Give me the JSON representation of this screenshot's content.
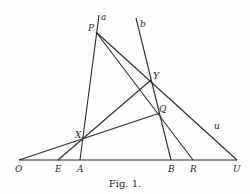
{
  "figure": {
    "caption": "Fig. 1.",
    "colors": {
      "ink": "#2b2b2b",
      "paper": "#fefefe"
    },
    "points": [
      {
        "id": "P",
        "x": 96,
        "y": 32,
        "lx": 88,
        "ly": 31
      },
      {
        "id": "Y",
        "x": 151,
        "y": 80,
        "lx": 153,
        "ly": 79
      },
      {
        "id": "Q",
        "x": 160,
        "y": 113,
        "lx": 159,
        "ly": 112
      },
      {
        "id": "X",
        "x": 82,
        "y": 138,
        "lx": 75,
        "ly": 138
      },
      {
        "id": "O",
        "x": 19,
        "y": 160,
        "lx": 15,
        "ly": 172
      },
      {
        "id": "E",
        "x": 58,
        "y": 160,
        "lx": 55,
        "ly": 172
      },
      {
        "id": "A",
        "x": 80,
        "y": 160,
        "lx": 77,
        "ly": 172
      },
      {
        "id": "B",
        "x": 171,
        "y": 160,
        "lx": 168,
        "ly": 172
      },
      {
        "id": "R",
        "x": 193,
        "y": 160,
        "lx": 190,
        "ly": 172
      },
      {
        "id": "U",
        "x": 237,
        "y": 160,
        "lx": 233,
        "ly": 172
      }
    ],
    "line_labels": [
      {
        "id": "a",
        "x": 101,
        "y": 20
      },
      {
        "id": "b",
        "x": 140,
        "y": 27
      },
      {
        "id": "u",
        "x": 214,
        "y": 129
      }
    ],
    "lines": [
      {
        "name": "line-a",
        "x1": 99,
        "y1": 15,
        "x2": 80,
        "y2": 160
      },
      {
        "name": "line-b",
        "x1": 136,
        "y1": 18,
        "x2": 171,
        "y2": 160
      },
      {
        "name": "line-PU",
        "x1": 96,
        "y1": 32,
        "x2": 237,
        "y2": 160
      },
      {
        "name": "line-PR",
        "x1": 96,
        "y1": 32,
        "x2": 193,
        "y2": 160
      },
      {
        "name": "line-OQ",
        "x1": 19,
        "y1": 160,
        "x2": 160,
        "y2": 113
      },
      {
        "name": "line-EY",
        "x1": 58,
        "y1": 160,
        "x2": 151,
        "y2": 80
      },
      {
        "name": "baseline-OU",
        "x1": 19,
        "y1": 160,
        "x2": 237,
        "y2": 160
      }
    ]
  }
}
